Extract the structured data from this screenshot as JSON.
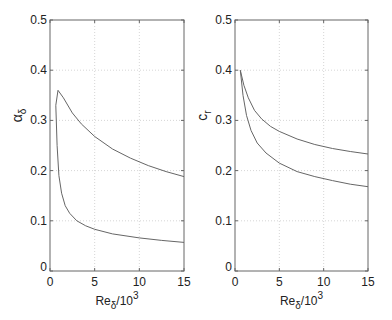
{
  "chart_data": [
    {
      "type": "line",
      "panel": "left",
      "title": "",
      "xlabel": "Re_δ/10^3",
      "xlabel_main": "Re",
      "xlabel_sub": "δ",
      "xlabel_tail": "/10",
      "xlabel_sup": "3",
      "ylabel": "α_δ",
      "ylabel_main": "α",
      "ylabel_sub": "δ",
      "xlim": [
        0,
        15
      ],
      "ylim": [
        0,
        0.5
      ],
      "xticks": [
        "0",
        "5",
        "10",
        "15"
      ],
      "yticks": [
        "0",
        "0.1",
        "0.2",
        "0.3",
        "0.4",
        "0.5"
      ],
      "grid": true,
      "series": [
        {
          "name": "upper branch",
          "x": [
            0.65,
            0.9,
            1.5,
            2.5,
            3.5,
            5,
            7,
            9,
            11,
            13,
            15
          ],
          "y": [
            0.33,
            0.36,
            0.345,
            0.315,
            0.293,
            0.268,
            0.243,
            0.225,
            0.21,
            0.198,
            0.188
          ]
        },
        {
          "name": "lower branch",
          "x": [
            0.65,
            0.8,
            1.0,
            1.3,
            1.7,
            2.2,
            3,
            4,
            5,
            7,
            10,
            12.5,
            15
          ],
          "y": [
            0.33,
            0.25,
            0.19,
            0.155,
            0.13,
            0.115,
            0.1,
            0.09,
            0.083,
            0.074,
            0.066,
            0.061,
            0.057
          ]
        }
      ]
    },
    {
      "type": "line",
      "panel": "right",
      "title": "",
      "xlabel": "Re_δ/10^3",
      "xlabel_main": "Re",
      "xlabel_sub": "δ",
      "xlabel_tail": "/10",
      "xlabel_sup": "3",
      "ylabel": "c_r",
      "ylabel_main": "c",
      "ylabel_sub": "r",
      "xlim": [
        0,
        15
      ],
      "ylim": [
        0,
        0.5
      ],
      "xticks": [
        "0",
        "5",
        "10",
        "15"
      ],
      "yticks": [
        "0",
        "0.1",
        "0.2",
        "0.3",
        "0.4",
        "0.5"
      ],
      "grid": true,
      "series": [
        {
          "name": "upper branch",
          "x": [
            0.6,
            1.0,
            1.5,
            2.2,
            3,
            4,
            5,
            7,
            9,
            11,
            13,
            15
          ],
          "y": [
            0.4,
            0.37,
            0.345,
            0.32,
            0.303,
            0.288,
            0.278,
            0.263,
            0.252,
            0.244,
            0.238,
            0.233
          ]
        },
        {
          "name": "lower branch",
          "x": [
            0.6,
            0.9,
            1.3,
            1.8,
            2.5,
            3.5,
            5,
            7,
            9,
            11,
            13,
            15
          ],
          "y": [
            0.4,
            0.35,
            0.31,
            0.28,
            0.255,
            0.235,
            0.215,
            0.198,
            0.188,
            0.18,
            0.173,
            0.168
          ]
        }
      ]
    }
  ],
  "colors": {
    "line": "#666666",
    "axis": "#666666",
    "grid": "#cccccc",
    "text": "#222222"
  }
}
